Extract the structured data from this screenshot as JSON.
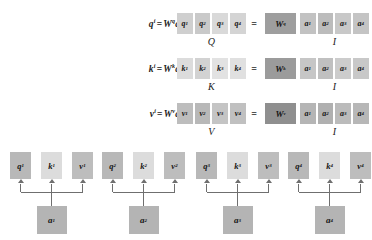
{
  "diagram": {
    "colors": {
      "cell_light": "#d6d6d6",
      "cell_mid": "#bfbfbf",
      "cell_dark": "#9e9e9e",
      "cell_k_light": "#dddddd",
      "arrow": "#6f6f6f",
      "text": "#151515",
      "background": "#ffffff"
    },
    "equation_rows": [
      {
        "id": "query-row",
        "equation": {
          "lhs_base": "q",
          "lhs_sup": "i",
          "eq": "=",
          "w_base": "W",
          "w_sup": "q",
          "a_base": "a",
          "a_sup": "i"
        },
        "output_cells": [
          {
            "base": "q",
            "sup": "1"
          },
          {
            "base": "q",
            "sup": "2"
          },
          {
            "base": "q",
            "sup": "3"
          },
          {
            "base": "q",
            "sup": "4"
          }
        ],
        "output_label": "Q",
        "equals": "=",
        "weight_cell": {
          "base": "W",
          "sup": "q"
        },
        "input_cells": [
          {
            "base": "a",
            "sup": "1"
          },
          {
            "base": "a",
            "sup": "2"
          },
          {
            "base": "a",
            "sup": "3"
          },
          {
            "base": "a",
            "sup": "4"
          }
        ],
        "input_label": "I"
      },
      {
        "id": "key-row",
        "equation": {
          "lhs_base": "k",
          "lhs_sup": "i",
          "eq": "=",
          "w_base": "W",
          "w_sup": "k",
          "a_base": "a",
          "a_sup": "i"
        },
        "output_cells": [
          {
            "base": "k",
            "sup": "1"
          },
          {
            "base": "k",
            "sup": "2"
          },
          {
            "base": "k",
            "sup": "3"
          },
          {
            "base": "k",
            "sup": "4"
          }
        ],
        "output_label": "K",
        "equals": "=",
        "weight_cell": {
          "base": "W",
          "sup": "k"
        },
        "input_cells": [
          {
            "base": "a",
            "sup": "1"
          },
          {
            "base": "a",
            "sup": "2"
          },
          {
            "base": "a",
            "sup": "3"
          },
          {
            "base": "a",
            "sup": "4"
          }
        ],
        "input_label": "I"
      },
      {
        "id": "value-row",
        "equation": {
          "lhs_base": "v",
          "lhs_sup": "i",
          "eq": "=",
          "w_base": "W",
          "w_sup": "v",
          "a_base": "a",
          "a_sup": "i"
        },
        "output_cells": [
          {
            "base": "v",
            "sup": "1"
          },
          {
            "base": "v",
            "sup": "2"
          },
          {
            "base": "v",
            "sup": "3"
          },
          {
            "base": "v",
            "sup": "4"
          }
        ],
        "output_label": "V",
        "equals": "=",
        "weight_cell": {
          "base": "W",
          "sup": "v"
        },
        "input_cells": [
          {
            "base": "a",
            "sup": "1"
          },
          {
            "base": "a",
            "sup": "2"
          },
          {
            "base": "a",
            "sup": "3"
          },
          {
            "base": "a",
            "sup": "4"
          }
        ],
        "input_label": "I"
      }
    ],
    "bottom_groups": [
      {
        "id": "group-1",
        "outputs": [
          {
            "base": "q",
            "sup": "1"
          },
          {
            "base": "k",
            "sup": "1"
          },
          {
            "base": "v",
            "sup": "1"
          }
        ],
        "input": {
          "base": "a",
          "sup": "1"
        }
      },
      {
        "id": "group-2",
        "outputs": [
          {
            "base": "q",
            "sup": "2"
          },
          {
            "base": "k",
            "sup": "2"
          },
          {
            "base": "v",
            "sup": "2"
          }
        ],
        "input": {
          "base": "a",
          "sup": "2"
        }
      },
      {
        "id": "group-3",
        "outputs": [
          {
            "base": "q",
            "sup": "3"
          },
          {
            "base": "k",
            "sup": "3"
          },
          {
            "base": "v",
            "sup": "3"
          }
        ],
        "input": {
          "base": "a",
          "sup": "3"
        }
      },
      {
        "id": "group-4",
        "outputs": [
          {
            "base": "q",
            "sup": "4"
          },
          {
            "base": "k",
            "sup": "4"
          },
          {
            "base": "v",
            "sup": "4"
          }
        ],
        "input": {
          "base": "a",
          "sup": "4"
        }
      }
    ]
  }
}
